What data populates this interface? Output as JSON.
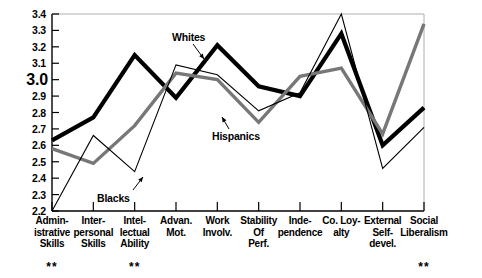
{
  "chart_data": {
    "type": "line",
    "title": "",
    "subtitle": "",
    "xlabel": "",
    "ylabel": "",
    "ylim": [
      2.2,
      3.4
    ],
    "ytick_step": 0.1,
    "yticks": [
      "2.2",
      "2.3",
      "2.4",
      "2.5",
      "2.6",
      "2.7",
      "2.8",
      "2.9",
      "3.0",
      "3.1",
      "3.2",
      "3.3",
      "3.4"
    ],
    "emphasized_ytick": "3.0",
    "grid": false,
    "legend_position": "inline-annotations",
    "categories": [
      "Admin-\nistrative\nSkills",
      "Inter-\npersonal\nSkills",
      "Intel-\nlectual\nAbility",
      "Advan.\nMot.",
      "Work\nInvolv.",
      "Stability\nOf\nPerf.",
      "Inde-\npendence",
      "Co. Loy-\nalty",
      "External\nSelf-\ndevel.",
      "Social\nLiberalism"
    ],
    "category_lines": [
      [
        "Admin-",
        "istrative",
        "Skills"
      ],
      [
        "Inter-",
        "personal",
        "Skills"
      ],
      [
        "Intel-",
        "lectual",
        "Ability"
      ],
      [
        "Advan.",
        "Mot."
      ],
      [
        "Work",
        "Involv."
      ],
      [
        "Stability",
        "Of",
        "Perf."
      ],
      [
        "Inde-",
        "pendence"
      ],
      [
        "Co. Loy-",
        "alty"
      ],
      [
        "External",
        "Self-",
        "devel."
      ],
      [
        "Social",
        "Liberalism"
      ]
    ],
    "significance_marks": [
      {
        "category_index": 0,
        "mark": "**"
      },
      {
        "category_index": 2,
        "mark": "**"
      },
      {
        "category_index": 9,
        "mark": "**"
      }
    ],
    "series": [
      {
        "name": "Whites",
        "style": "thick-black",
        "color": "#000000",
        "width": 4.2,
        "values": [
          2.63,
          2.77,
          3.15,
          2.89,
          3.21,
          2.96,
          2.9,
          3.28,
          2.6,
          2.83
        ]
      },
      {
        "name": "Hispanics",
        "style": "medium-gray",
        "color": "#777777",
        "width": 3.4,
        "values": [
          2.58,
          2.49,
          2.72,
          3.04,
          3.0,
          2.74,
          3.02,
          3.07,
          2.67,
          3.34
        ]
      },
      {
        "name": "Blacks",
        "style": "thin-black",
        "color": "#000000",
        "width": 1.1,
        "values": [
          2.2,
          2.66,
          2.44,
          3.09,
          3.03,
          2.81,
          2.92,
          3.4,
          2.46,
          2.71
        ]
      }
    ],
    "annotations": [
      {
        "label": "Whites",
        "points_to_series": "Whites"
      },
      {
        "label": "Hispanics",
        "points_to_series": "Hispanics"
      },
      {
        "label": "Blacks",
        "points_to_series": "Blacks"
      }
    ]
  }
}
